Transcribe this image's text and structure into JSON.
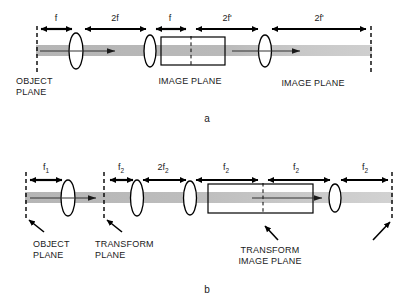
{
  "figure": {
    "background_color": "#ffffff",
    "ink_color": "#000000",
    "beam_color": "#b3b3b3",
    "panels": [
      {
        "id": "a",
        "letter": "a",
        "dimension_labels": [
          {
            "id": "a-dim-1",
            "text": "f"
          },
          {
            "id": "a-dim-2",
            "text": "2f"
          },
          {
            "id": "a-dim-3",
            "text": "f"
          },
          {
            "id": "a-dim-4",
            "text": "2f'"
          },
          {
            "id": "a-dim-5",
            "text": "2f'"
          }
        ],
        "plane_labels": [
          {
            "id": "a-plane-object",
            "line1": "OBJECT",
            "line2": "PLANE"
          },
          {
            "id": "a-plane-image-1",
            "line1": "IMAGE PLANE",
            "line2": ""
          },
          {
            "id": "a-plane-image-2",
            "line1": "IMAGE PLANE",
            "line2": ""
          }
        ]
      },
      {
        "id": "b",
        "letter": "b",
        "dimension_labels": [
          {
            "id": "b-dim-1",
            "base": "f",
            "subscript": "1"
          },
          {
            "id": "b-dim-2",
            "base": "f",
            "subscript": "2"
          },
          {
            "id": "b-dim-3",
            "base": "2f",
            "subscript": "2"
          },
          {
            "id": "b-dim-4",
            "base": "f",
            "subscript": "2"
          },
          {
            "id": "b-dim-5",
            "base": "f",
            "subscript": "2"
          },
          {
            "id": "b-dim-6",
            "base": "f",
            "subscript": "2"
          }
        ],
        "plane_labels": [
          {
            "id": "b-plane-object",
            "line1": "OBJECT",
            "line2": "PLANE"
          },
          {
            "id": "b-plane-transform",
            "line1": "TRANSFORM",
            "line2": "PLANE"
          },
          {
            "id": "b-plane-transform-image",
            "line1": "TRANSFORM",
            "line2": "IMAGE PLANE"
          }
        ]
      }
    ]
  }
}
